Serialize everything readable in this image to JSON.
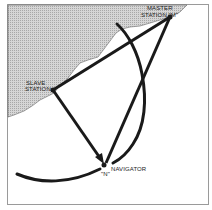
{
  "diagram": {
    "type": "hyperbolic-navigation-geometry",
    "labels": {
      "master_line1": "MASTER",
      "master_line2": "STATION \"M\"",
      "slave_line1": "SLAVE",
      "slave_line2": "STATION",
      "navigator": "NAVIGATOR",
      "navigator_mark": "\"N\""
    },
    "points": {
      "master": {
        "x": 170,
        "y": 17,
        "label": "M"
      },
      "slave": {
        "x": 53,
        "y": 90,
        "label": "S"
      },
      "navigator": {
        "x": 104,
        "y": 165,
        "label": "N"
      }
    },
    "colors": {
      "land": "#c9c9c9",
      "ink": "#1a1a1a",
      "frame": "#9a9a9a",
      "water": "#ffffff"
    }
  }
}
